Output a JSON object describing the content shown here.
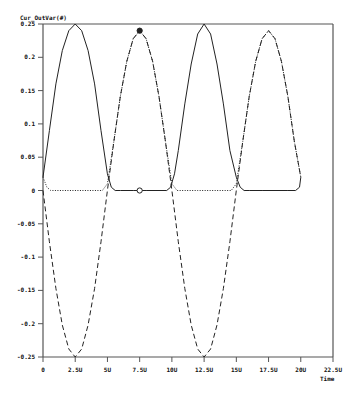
{
  "chart_data": {
    "type": "line",
    "title": "Cur_OutVar(#)",
    "xlabel": "Time",
    "ylabel": "Cur_OutVar(#)",
    "xlim": [
      0,
      22.5
    ],
    "ylim": [
      -0.25,
      0.25
    ],
    "grid": false,
    "legend": "none",
    "x_ticks": [
      "0",
      "2.5U",
      "5U",
      "7.5U",
      "10U",
      "12.5U",
      "15U",
      "17.5U",
      "20U",
      "22.5U"
    ],
    "x_tick_values": [
      0,
      2.5,
      5,
      7.5,
      10,
      12.5,
      15,
      17.5,
      20,
      22.5
    ],
    "y_ticks": [
      "0.25",
      "0.2",
      "0.15",
      "0.1",
      "0.05",
      "0",
      "-0.05",
      "-0.1",
      "-0.15",
      "-0.2",
      "-0.25"
    ],
    "y_tick_values": [
      0.25,
      0.2,
      0.15,
      0.1,
      0.05,
      0,
      -0.05,
      -0.1,
      -0.15,
      -0.2,
      -0.25
    ],
    "series": [
      {
        "name": "solid",
        "style": "solid",
        "x": [
          0,
          0.5,
          1,
          1.5,
          2,
          2.5,
          3,
          3.5,
          4,
          4.5,
          5,
          5.3,
          5.6,
          6,
          7,
          8,
          9,
          9.6,
          9.9,
          10.2,
          10.5,
          11,
          11.5,
          12,
          12.5,
          13,
          13.5,
          14,
          14.5,
          15,
          15.3,
          15.6,
          16,
          17,
          18,
          19,
          19.6,
          19.9,
          20
        ],
        "y": [
          0.02,
          0.09,
          0.16,
          0.21,
          0.24,
          0.25,
          0.24,
          0.21,
          0.16,
          0.09,
          0.025,
          0.005,
          0.0,
          0.0,
          0.0,
          0.0,
          0.0,
          0.0,
          0.005,
          0.025,
          0.06,
          0.13,
          0.19,
          0.235,
          0.25,
          0.235,
          0.19,
          0.13,
          0.06,
          0.02,
          0.005,
          0.0,
          0.0,
          0.0,
          0.0,
          0.0,
          0.0,
          0.005,
          0.02
        ]
      },
      {
        "name": "dashed",
        "style": "dashed",
        "x": [
          0,
          0.5,
          1,
          1.5,
          2,
          2.5,
          3,
          3.5,
          4,
          4.5,
          5,
          5.5,
          6,
          6.5,
          7,
          7.5,
          8,
          8.5,
          9,
          9.5,
          10,
          10.5,
          11,
          11.5,
          12,
          12.5,
          13,
          13.5,
          14,
          14.5,
          15,
          15.5,
          16,
          16.5,
          17,
          17.5,
          18,
          18.5,
          19,
          19.5,
          20
        ],
        "y": [
          0.0,
          -0.077,
          -0.147,
          -0.202,
          -0.238,
          -0.25,
          -0.238,
          -0.202,
          -0.147,
          -0.077,
          0.0,
          0.074,
          0.141,
          0.194,
          0.228,
          0.24,
          0.228,
          0.194,
          0.141,
          0.074,
          0.0,
          -0.077,
          -0.147,
          -0.202,
          -0.238,
          -0.25,
          -0.238,
          -0.202,
          -0.147,
          -0.077,
          0.0,
          0.074,
          0.141,
          0.194,
          0.228,
          0.24,
          0.228,
          0.194,
          0.141,
          0.074,
          0.02
        ]
      },
      {
        "name": "dotted",
        "style": "dotted",
        "x": [
          0,
          0.3,
          0.6,
          1,
          2,
          3,
          4,
          4.6,
          5,
          5.5,
          6,
          6.5,
          7,
          7.5,
          8,
          8.5,
          9,
          9.5,
          10,
          10.4,
          11,
          12,
          13,
          14,
          14.6,
          15,
          15.5,
          16,
          16.5,
          17,
          17.5,
          18,
          18.5,
          19,
          19.5,
          20
        ],
        "y": [
          0.02,
          0.005,
          0.0,
          0.0,
          0.0,
          0.0,
          0.0,
          0.0,
          0.01,
          0.074,
          0.141,
          0.194,
          0.228,
          0.24,
          0.228,
          0.194,
          0.141,
          0.074,
          0.01,
          0.0,
          0.0,
          0.0,
          0.0,
          0.0,
          0.0,
          0.01,
          0.074,
          0.141,
          0.194,
          0.228,
          0.24,
          0.228,
          0.194,
          0.141,
          0.074,
          0.02
        ]
      }
    ],
    "markers": [
      {
        "x": 7.5,
        "y": 0.24,
        "style": "filled-circle"
      },
      {
        "x": 7.5,
        "y": 0.0,
        "style": "hollow-circle"
      }
    ]
  },
  "plot": {
    "left": 43,
    "right": 333,
    "top": 24,
    "bottom": 357,
    "axis_color": "#555555",
    "line_color": "#222222"
  }
}
